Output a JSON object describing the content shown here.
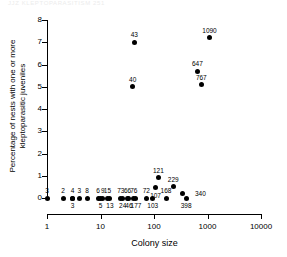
{
  "faint_header_text": "JJZ   KLEPTOPARASITISM   251",
  "chart_data": {
    "type": "scatter",
    "title": "",
    "xlabel": "Colony size",
    "ylabel": "Percentage of nests with one or more kleptoparasitic juveniles",
    "xscale": "log",
    "xlim": [
      1,
      10000
    ],
    "ylim": [
      0,
      8
    ],
    "xticks": [
      1,
      10,
      100,
      1000,
      10000
    ],
    "xtick_labels": [
      "1",
      "10",
      "100",
      "1000",
      "10000"
    ],
    "yticks": [
      0,
      1,
      2,
      3,
      4,
      5,
      6,
      7,
      8
    ],
    "ytick_labels": [
      "0",
      "1",
      "2",
      "3",
      "4",
      "5",
      "6",
      "7",
      "8"
    ],
    "grid": false,
    "legend": "none",
    "point_color": "#000000",
    "point_label_note": "each point is annotated with its colony size",
    "points": [
      {
        "label": "3",
        "x": 1,
        "y": 0,
        "label_pos": "above"
      },
      {
        "label": "2",
        "x": 2,
        "y": 0,
        "label_pos": "above"
      },
      {
        "label": "4",
        "x": 3,
        "y": 0,
        "label_pos": "above"
      },
      {
        "label": "3",
        "x": 3,
        "y": 0,
        "label_pos": "below"
      },
      {
        "label": "3",
        "x": 4,
        "y": 0,
        "label_pos": "above"
      },
      {
        "label": "8",
        "x": 5.6,
        "y": 0,
        "label_pos": "above"
      },
      {
        "label": "6",
        "x": 9,
        "y": 0,
        "label_pos": "above"
      },
      {
        "label": "5",
        "x": 10,
        "y": 0,
        "label_pos": "below"
      },
      {
        "label": "9",
        "x": 11,
        "y": 0,
        "label_pos": "above"
      },
      {
        "label": "15",
        "x": 13.5,
        "y": 0,
        "label_pos": "above"
      },
      {
        "label": "13",
        "x": 15,
        "y": 0,
        "label_pos": "below"
      },
      {
        "label": "73",
        "x": 24,
        "y": 0,
        "label_pos": "above"
      },
      {
        "label": "24",
        "x": 26,
        "y": 0,
        "label_pos": "below"
      },
      {
        "label": "66",
        "x": 32,
        "y": 0,
        "label_pos": "above"
      },
      {
        "label": "46",
        "x": 34,
        "y": 0,
        "label_pos": "below"
      },
      {
        "label": "76",
        "x": 42,
        "y": 0,
        "label_pos": "above"
      },
      {
        "label": "177",
        "x": 46,
        "y": 0,
        "label_pos": "below"
      },
      {
        "label": "72",
        "x": 72,
        "y": 0,
        "label_pos": "above"
      },
      {
        "label": "103",
        "x": 95,
        "y": 0,
        "label_pos": "below"
      },
      {
        "label": "168",
        "x": 168,
        "y": 0,
        "label_pos": "above"
      },
      {
        "label": "398",
        "x": 398,
        "y": 0,
        "label_pos": "below"
      },
      {
        "label": "121",
        "x": 121,
        "y": 0.9,
        "label_pos": "above"
      },
      {
        "label": "107",
        "x": 107,
        "y": 0.45,
        "label_pos": "below"
      },
      {
        "label": "229",
        "x": 229,
        "y": 0.5,
        "label_pos": "above"
      },
      {
        "label": "340",
        "x": 340,
        "y": 0.2,
        "label_pos": "right"
      },
      {
        "label": "40",
        "x": 40,
        "y": 5.0,
        "label_pos": "above"
      },
      {
        "label": "43",
        "x": 43,
        "y": 7.0,
        "label_pos": "above"
      },
      {
        "label": "647",
        "x": 647,
        "y": 5.7,
        "label_pos": "above"
      },
      {
        "label": "767",
        "x": 767,
        "y": 5.1,
        "label_pos": "above"
      },
      {
        "label": "1090",
        "x": 1090,
        "y": 7.2,
        "label_pos": "above"
      }
    ]
  }
}
